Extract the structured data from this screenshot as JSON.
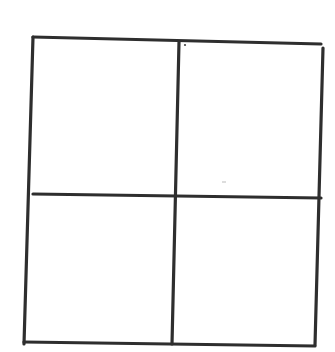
{
  "diagram": {
    "type": "grid-2x2",
    "stroke_color": "#2e2e2e",
    "background_color": "#ffffff",
    "stroke_width": 3.2,
    "outer_frame": {
      "top_left": [
        33,
        37
      ],
      "top_right": [
        321,
        44
      ],
      "bottom_right": [
        315,
        346
      ],
      "bottom_left": [
        24,
        342
      ]
    },
    "lines": [
      {
        "name": "top-edge",
        "x1": 33,
        "y1": 37,
        "x2": 321,
        "y2": 44
      },
      {
        "name": "right-edge",
        "x1": 323,
        "y1": 48,
        "x2": 315,
        "y2": 345
      },
      {
        "name": "bottom-edge",
        "x1": 24,
        "y1": 342,
        "x2": 315,
        "y2": 346
      },
      {
        "name": "left-edge",
        "x1": 33,
        "y1": 37,
        "x2": 24,
        "y2": 344
      },
      {
        "name": "vertical-divider",
        "x1": 179,
        "y1": 42,
        "x2": 172,
        "y2": 344
      },
      {
        "name": "horizontal-divider",
        "x1": 33,
        "y1": 194,
        "x2": 321,
        "y2": 198
      }
    ],
    "quadrants": [
      {
        "name": "top-left-quadrant",
        "points": "35,39 178,43 174,195 34,194"
      },
      {
        "name": "top-right-quadrant",
        "points": "181,43 320,46 319,197 176,196"
      },
      {
        "name": "bottom-left-quadrant",
        "points": "34,196 173,197 171,342 26,340"
      },
      {
        "name": "bottom-right-quadrant",
        "points": "175,197 319,199 314,344 173,343"
      }
    ]
  }
}
